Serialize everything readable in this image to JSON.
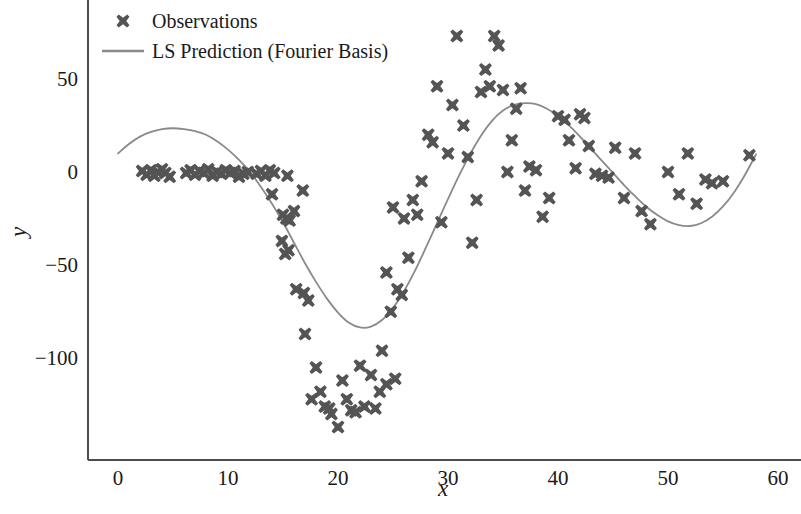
{
  "chart_data": {
    "type": "scatter",
    "title": "",
    "xlabel": "x",
    "ylabel": "y",
    "xlim": [
      -1,
      62
    ],
    "ylim": [
      -148,
      86
    ],
    "xticks": [
      0,
      10,
      20,
      30,
      40,
      50,
      60
    ],
    "yticks": [
      50,
      0,
      -50,
      -100
    ],
    "xtick_labels": [
      "0",
      "10",
      "20",
      "30",
      "40",
      "50",
      "60"
    ],
    "ytick_labels": [
      "50",
      "0",
      "−50",
      "−100"
    ],
    "grid": false,
    "legend_position": "upper left",
    "legend_frame": false,
    "colors": {
      "marker": "#545454",
      "line": "#8a8a8a",
      "axis": "#4d4d4d",
      "text": "#1a1a1a",
      "background": "#ffffff"
    },
    "series": [
      {
        "name": "Observations",
        "type": "scatter",
        "marker": "X",
        "marker_size": 13,
        "color": "#545454",
        "points": [
          [
            2.2,
            0.5
          ],
          [
            2.6,
            -1.5
          ],
          [
            3.0,
            1.0
          ],
          [
            3.3,
            -2.0
          ],
          [
            3.6,
            0.0
          ],
          [
            4.0,
            1.5
          ],
          [
            4.3,
            -0.5
          ],
          [
            4.7,
            -2.5
          ],
          [
            6.2,
            -0.5
          ],
          [
            6.6,
            1.0
          ],
          [
            7.0,
            -1.5
          ],
          [
            7.4,
            0.5
          ],
          [
            7.8,
            -0.5
          ],
          [
            8.2,
            1.5
          ],
          [
            8.6,
            -2.0
          ],
          [
            9.0,
            0.0
          ],
          [
            9.4,
            -1.0
          ],
          [
            9.8,
            1.0
          ],
          [
            10.2,
            -0.5
          ],
          [
            10.6,
            0.5
          ],
          [
            11.0,
            -2.5
          ],
          [
            11.4,
            -1.0
          ],
          [
            11.8,
            0.0
          ],
          [
            12.6,
            -1.0
          ],
          [
            13.0,
            0.5
          ],
          [
            13.4,
            -2.0
          ],
          [
            13.8,
            1.0
          ],
          [
            14.2,
            -0.5
          ],
          [
            15.4,
            -2.0
          ],
          [
            14.0,
            -12.0
          ],
          [
            15.0,
            -23.0
          ],
          [
            15.3,
            -25.0
          ],
          [
            15.6,
            -26.0
          ],
          [
            16.0,
            -21.0
          ],
          [
            14.9,
            -37.0
          ],
          [
            15.5,
            -42.0
          ],
          [
            15.2,
            -44.0
          ],
          [
            16.8,
            -10.0
          ],
          [
            16.2,
            -63.0
          ],
          [
            16.9,
            -65.0
          ],
          [
            17.3,
            -69.0
          ],
          [
            17.0,
            -87.0
          ],
          [
            18.0,
            -105.0
          ],
          [
            18.4,
            -118.0
          ],
          [
            17.6,
            -122.0
          ],
          [
            18.8,
            -126.0
          ],
          [
            19.2,
            -127.0
          ],
          [
            19.4,
            -130.0
          ],
          [
            20.0,
            -137.0
          ],
          [
            20.4,
            -112.0
          ],
          [
            20.8,
            -122.0
          ],
          [
            21.2,
            -128.0
          ],
          [
            21.6,
            -129.0
          ],
          [
            22.0,
            -104.0
          ],
          [
            22.4,
            -126.0
          ],
          [
            23.0,
            -109.0
          ],
          [
            23.4,
            -127.0
          ],
          [
            23.8,
            -118.0
          ],
          [
            24.4,
            -114.0
          ],
          [
            24.0,
            -96.0
          ],
          [
            25.2,
            -111.0
          ],
          [
            24.8,
            -75.0
          ],
          [
            25.4,
            -63.0
          ],
          [
            25.8,
            -66.0
          ],
          [
            24.4,
            -54.0
          ],
          [
            26.4,
            -46.0
          ],
          [
            26.0,
            -25.0
          ],
          [
            25.0,
            -19.0
          ],
          [
            26.8,
            -15.0
          ],
          [
            27.2,
            -23.0
          ],
          [
            27.6,
            -5.0
          ],
          [
            28.2,
            20.0
          ],
          [
            28.6,
            16.0
          ],
          [
            29.0,
            46.0
          ],
          [
            29.4,
            -27.0
          ],
          [
            30.0,
            10.0
          ],
          [
            30.4,
            36.0
          ],
          [
            30.8,
            73.0
          ],
          [
            31.4,
            25.0
          ],
          [
            31.8,
            8.0
          ],
          [
            32.2,
            -38.0
          ],
          [
            32.6,
            -15.0
          ],
          [
            33.0,
            43.0
          ],
          [
            33.4,
            55.0
          ],
          [
            33.8,
            46.0
          ],
          [
            34.2,
            73.0
          ],
          [
            34.6,
            68.0
          ],
          [
            35.0,
            44.0
          ],
          [
            35.4,
            0.0
          ],
          [
            35.8,
            17.0
          ],
          [
            36.2,
            34.0
          ],
          [
            36.6,
            45.0
          ],
          [
            37.0,
            -10.0
          ],
          [
            37.4,
            3.0
          ],
          [
            38.0,
            1.0
          ],
          [
            38.6,
            -24.0
          ],
          [
            39.2,
            -14.0
          ],
          [
            40.0,
            30.0
          ],
          [
            40.6,
            28.0
          ],
          [
            41.0,
            17.0
          ],
          [
            41.6,
            2.0
          ],
          [
            42.0,
            31.0
          ],
          [
            42.4,
            29.0
          ],
          [
            42.8,
            14.0
          ],
          [
            43.4,
            -1.0
          ],
          [
            44.0,
            -2.0
          ],
          [
            44.6,
            -3.0
          ],
          [
            45.2,
            13.0
          ],
          [
            46.0,
            -14.0
          ],
          [
            47.0,
            10.0
          ],
          [
            47.6,
            -21.0
          ],
          [
            48.4,
            -28.0
          ],
          [
            50.0,
            0.0
          ],
          [
            51.0,
            -12.0
          ],
          [
            51.8,
            10.0
          ],
          [
            52.6,
            -17.0
          ],
          [
            53.4,
            -4.0
          ],
          [
            54.0,
            -6.0
          ],
          [
            55.0,
            -5.0
          ],
          [
            57.4,
            9.0
          ]
        ]
      },
      {
        "name": "LS Prediction (Fourier Basis)",
        "type": "line",
        "color": "#8a8a8a",
        "linewidth": 1.8,
        "points": [
          [
            0.0,
            10.0
          ],
          [
            1.0,
            15.0
          ],
          [
            2.0,
            19.0
          ],
          [
            3.0,
            21.5
          ],
          [
            4.0,
            23.0
          ],
          [
            5.0,
            23.5
          ],
          [
            6.0,
            23.0
          ],
          [
            7.0,
            22.0
          ],
          [
            8.0,
            20.0
          ],
          [
            9.0,
            16.5
          ],
          [
            10.0,
            12.0
          ],
          [
            11.0,
            6.5
          ],
          [
            12.0,
            0.0
          ],
          [
            13.0,
            -8.0
          ],
          [
            14.0,
            -17.0
          ],
          [
            15.0,
            -27.0
          ],
          [
            16.0,
            -38.0
          ],
          [
            17.0,
            -49.0
          ],
          [
            18.0,
            -59.0
          ],
          [
            19.0,
            -68.0
          ],
          [
            20.0,
            -75.5
          ],
          [
            21.0,
            -81.0
          ],
          [
            22.0,
            -83.5
          ],
          [
            23.0,
            -83.0
          ],
          [
            24.0,
            -79.5
          ],
          [
            25.0,
            -73.0
          ],
          [
            26.0,
            -64.0
          ],
          [
            27.0,
            -53.0
          ],
          [
            28.0,
            -40.5
          ],
          [
            29.0,
            -27.5
          ],
          [
            30.0,
            -14.5
          ],
          [
            31.0,
            -2.0
          ],
          [
            32.0,
            9.5
          ],
          [
            33.0,
            19.5
          ],
          [
            34.0,
            27.5
          ],
          [
            35.0,
            33.0
          ],
          [
            36.0,
            36.0
          ],
          [
            37.0,
            37.0
          ],
          [
            38.0,
            36.5
          ],
          [
            39.0,
            34.0
          ],
          [
            40.0,
            30.0
          ],
          [
            41.0,
            25.0
          ],
          [
            42.0,
            19.0
          ],
          [
            43.0,
            12.5
          ],
          [
            44.0,
            6.0
          ],
          [
            45.0,
            -0.5
          ],
          [
            46.0,
            -7.0
          ],
          [
            47.0,
            -13.0
          ],
          [
            48.0,
            -18.5
          ],
          [
            49.0,
            -23.0
          ],
          [
            50.0,
            -26.5
          ],
          [
            51.0,
            -28.5
          ],
          [
            52.0,
            -29.0
          ],
          [
            53.0,
            -27.5
          ],
          [
            54.0,
            -24.0
          ],
          [
            55.0,
            -18.5
          ],
          [
            56.0,
            -11.0
          ],
          [
            57.0,
            -1.5
          ],
          [
            58.0,
            9.5
          ]
        ]
      }
    ]
  },
  "legend": {
    "items": [
      {
        "label": "Observations",
        "kind": "marker"
      },
      {
        "label": "LS Prediction (Fourier Basis)",
        "kind": "line"
      }
    ]
  },
  "axes": {
    "xlabel": "x",
    "ylabel": "y"
  }
}
